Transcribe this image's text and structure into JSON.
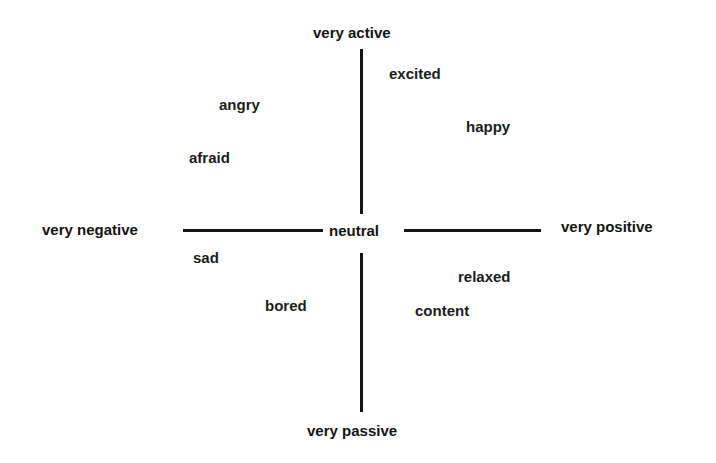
{
  "diagram": {
    "title": "",
    "type": "circumplex model of affect (valence × arousal)",
    "axes": {
      "valence": {
        "negative_label": "very negative",
        "positive_label": "very positive"
      },
      "arousal": {
        "active_label": "very active",
        "passive_label": "very passive"
      },
      "center_label": "neutral"
    },
    "emotions": [
      {
        "label": "excited",
        "quadrant": "positive-active"
      },
      {
        "label": "happy",
        "quadrant": "positive-active"
      },
      {
        "label": "angry",
        "quadrant": "negative-active"
      },
      {
        "label": "afraid",
        "quadrant": "negative-active"
      },
      {
        "label": "sad",
        "quadrant": "negative-passive"
      },
      {
        "label": "bored",
        "quadrant": "negative-passive"
      },
      {
        "label": "relaxed",
        "quadrant": "positive-passive"
      },
      {
        "label": "content",
        "quadrant": "positive-passive"
      }
    ],
    "colors": {
      "background": "#ffffff",
      "text": "#1a1a1a",
      "lines": "#141414"
    }
  }
}
